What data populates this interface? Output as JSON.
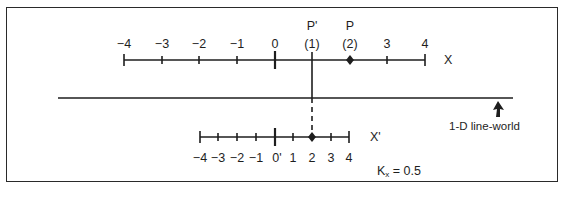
{
  "diagram": {
    "upper_axis": {
      "name": "X",
      "ticks": [
        "−4",
        "−3",
        "−2",
        "−1",
        "0",
        "(1)",
        "(2)",
        "3",
        "4"
      ],
      "point_labels": {
        "p_prime": "P'",
        "p": "P"
      }
    },
    "line_world": {
      "label": "1-D line-world"
    },
    "lower_axis": {
      "name": "X'",
      "ticks": [
        "−4",
        "−3",
        "−2",
        "−1",
        "0'",
        "1",
        "2",
        "3",
        "4"
      ]
    },
    "scale_factor": {
      "symbol": "K",
      "subscript": "x",
      "value": "= 0.5"
    },
    "colors": {
      "ink": "#1e1e1e",
      "background": "#ffffff"
    }
  }
}
